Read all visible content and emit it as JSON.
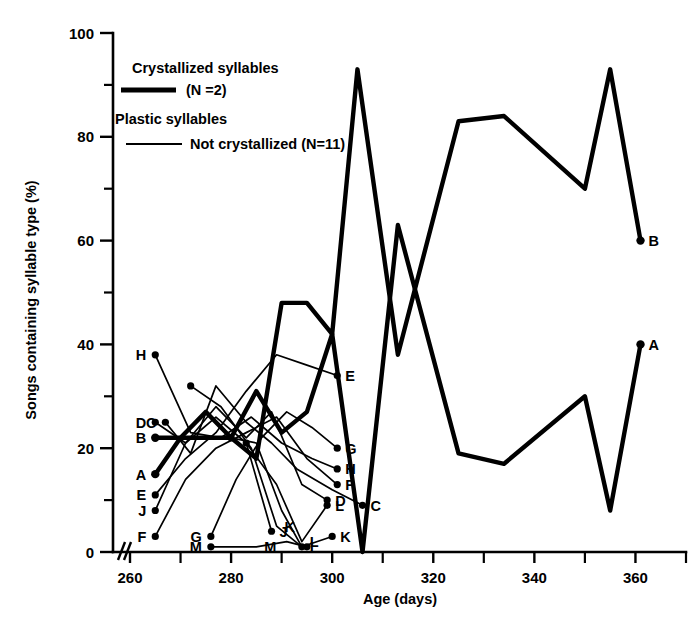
{
  "chart_data": {
    "type": "line",
    "title": "",
    "xlabel": "Age (days)",
    "ylabel": "Songs containing syllable type (%)",
    "xlim": [
      260,
      370
    ],
    "ylim": [
      0,
      100
    ],
    "x_ticks": [
      260,
      270,
      280,
      290,
      300,
      310,
      320,
      330,
      340,
      350,
      360,
      370
    ],
    "x_tick_labels": [
      "260",
      "",
      "280",
      "",
      "300",
      "",
      "320",
      "",
      "340",
      "",
      "360",
      ""
    ],
    "y_ticks": [
      0,
      10,
      20,
      30,
      40,
      50,
      60,
      70,
      80,
      90,
      100
    ],
    "y_tick_labels": [
      "0",
      "",
      "20",
      "",
      "40",
      "",
      "60",
      "",
      "80",
      "",
      "100"
    ],
    "grid": false,
    "axis_break": "//",
    "legend": {
      "position": "upper-left-inside",
      "entries": [
        {
          "title": "Crystallized syllables",
          "sub": "(N =2)",
          "style": "thick",
          "n": 2
        },
        {
          "title": "Plastic syllables",
          "sub": "Not crystallized (N=11)",
          "style": "thin",
          "n": 11
        }
      ]
    },
    "series": [
      {
        "name": "A",
        "style": "thick",
        "start_label": "A",
        "end_label": "A",
        "x": [
          265,
          270,
          275,
          280,
          285,
          290,
          295,
          300,
          306,
          313,
          325,
          334,
          350,
          355,
          361
        ],
        "y": [
          15,
          22,
          27,
          22,
          31,
          23,
          27,
          42,
          0,
          63,
          19,
          17,
          30,
          8,
          40
        ]
      },
      {
        "name": "B",
        "style": "thick",
        "start_label": "B",
        "end_label": "B",
        "x": [
          265,
          270,
          275,
          280,
          285,
          290,
          295,
          300,
          305,
          313,
          325,
          334,
          350,
          355,
          361
        ],
        "y": [
          22,
          22,
          22,
          22,
          18,
          48,
          48,
          42,
          93,
          38,
          83,
          84,
          70,
          93,
          60
        ]
      },
      {
        "name": "C",
        "style": "thin",
        "start_label": "C",
        "end_label": "C",
        "x": [
          267,
          272,
          277,
          283,
          288,
          293,
          300,
          306
        ],
        "y": [
          25,
          19,
          32,
          25,
          21,
          16,
          12,
          9
        ]
      },
      {
        "name": "D",
        "style": "thin",
        "start_label": "D",
        "end_label": "D",
        "x": [
          265,
          271,
          277,
          283,
          288,
          294,
          299
        ],
        "y": [
          25,
          21,
          28,
          22,
          27,
          13,
          10
        ]
      },
      {
        "name": "E",
        "style": "thin",
        "start_label": "E",
        "end_label": "E",
        "x": [
          265,
          271,
          277,
          283,
          289,
          295,
          301
        ],
        "y": [
          11,
          18,
          23,
          31,
          38,
          36,
          34
        ]
      },
      {
        "name": "F",
        "style": "thin",
        "start_label": "F",
        "end_label": "F",
        "x": [
          265,
          271,
          277,
          283,
          289,
          295,
          301
        ],
        "y": [
          3,
          14,
          20,
          23,
          26,
          18,
          13
        ]
      },
      {
        "name": "G",
        "style": "thin",
        "start_label": "G",
        "end_label": "G",
        "x": [
          276,
          281,
          286,
          291,
          296,
          301
        ],
        "y": [
          3,
          14,
          22,
          27,
          24,
          20
        ]
      },
      {
        "name": "H",
        "style": "thin",
        "start_label": "H",
        "end_label": "H",
        "x": [
          265,
          272,
          278,
          284,
          290,
          296,
          301
        ],
        "y": [
          38,
          23,
          22,
          26,
          21,
          18,
          16
        ]
      },
      {
        "name": "I",
        "style": "thin",
        "start_label": "",
        "end_label": "I",
        "x": [
          280,
          285,
          290,
          294
        ],
        "y": [
          22,
          21,
          8,
          1
        ]
      },
      {
        "name": "J",
        "style": "thin",
        "start_label": "J",
        "end_label": "J",
        "x": [
          265,
          271,
          277,
          283,
          288
        ],
        "y": [
          8,
          21,
          26,
          21,
          4
        ]
      },
      {
        "name": "K",
        "style": "thin",
        "start_label": "K",
        "end_label": "K",
        "x": [
          272,
          278,
          284,
          289,
          294,
          300
        ],
        "y": [
          32,
          28,
          20,
          5,
          1,
          3
        ]
      },
      {
        "name": "L",
        "style": "thin",
        "start_label": "L",
        "end_label": "L",
        "x": [
          283,
          289,
          294,
          299
        ],
        "y": [
          21,
          13,
          2,
          9
        ]
      },
      {
        "name": "M",
        "style": "thin",
        "start_label": "M",
        "end_label": "M",
        "x": [
          276,
          285,
          291,
          295
        ],
        "y": [
          1,
          1,
          2,
          1
        ]
      }
    ],
    "point_labels_left": [
      {
        "label": "H",
        "x": 265,
        "y": 38
      },
      {
        "label": "D",
        "x": 265,
        "y": 25
      },
      {
        "label": "C",
        "x": 267,
        "y": 25
      },
      {
        "label": "B",
        "x": 265,
        "y": 22
      },
      {
        "label": "A",
        "x": 265,
        "y": 15
      },
      {
        "label": "E",
        "x": 265,
        "y": 11
      },
      {
        "label": "J",
        "x": 265,
        "y": 8
      },
      {
        "label": "F",
        "x": 265,
        "y": 3
      },
      {
        "label": "G",
        "x": 276,
        "y": 3
      },
      {
        "label": "M",
        "x": 276,
        "y": 1
      }
    ],
    "point_labels_right": [
      {
        "label": "E",
        "x": 301,
        "y": 34
      },
      {
        "label": "G",
        "x": 301,
        "y": 20
      },
      {
        "label": "H",
        "x": 301,
        "y": 16
      },
      {
        "label": "F",
        "x": 301,
        "y": 13
      },
      {
        "label": "D",
        "x": 299,
        "y": 10
      },
      {
        "label": "L",
        "x": 299,
        "y": 9
      },
      {
        "label": "C",
        "x": 306,
        "y": 9
      },
      {
        "label": "K",
        "x": 300,
        "y": 3
      },
      {
        "label": "M",
        "x": 285,
        "y": 1
      },
      {
        "label": "J",
        "x": 288,
        "y": 4
      },
      {
        "label": "K",
        "x": 289,
        "y": 5
      },
      {
        "label": "I",
        "x": 294,
        "y": 1
      },
      {
        "label": "L",
        "x": 294,
        "y": 2
      },
      {
        "label": "B",
        "x": 361,
        "y": 60
      },
      {
        "label": "A",
        "x": 361,
        "y": 40
      }
    ]
  }
}
